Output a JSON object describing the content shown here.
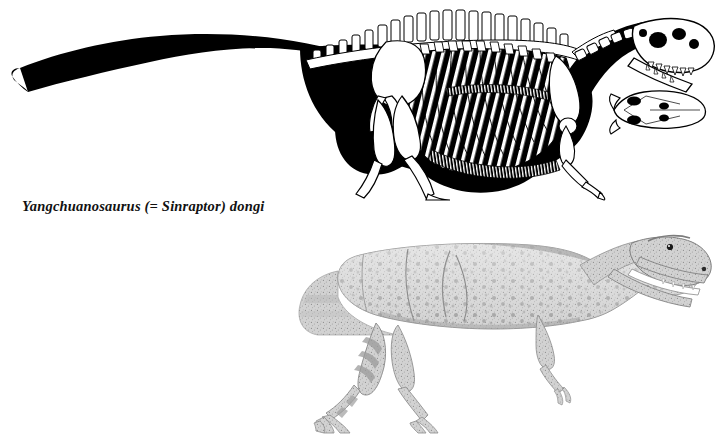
{
  "plate": {
    "background_color": "#ffffff",
    "width": 723,
    "height": 436,
    "caption": "Yangchuanosaurus (= Sinraptor) dongi",
    "caption_style": "italic-serif-bold",
    "ink_color": "#000000",
    "pencil_tone_color": "#8d8d8d"
  },
  "figures": [
    {
      "id": "skeletal-reconstruction",
      "label": "Yangchuanosaurus skeletal reconstruction",
      "technique": "ink line drawing, black body silhouette with white bones",
      "view": "lateral, facing right",
      "pose": "striding, mouth open",
      "parts": [
        "tail",
        "dorsal vertebrae",
        "neural spines",
        "ribcage",
        "gastralia",
        "pelvis",
        "ilium",
        "femur",
        "tibia",
        "metatarsus",
        "pes with claws",
        "scapula",
        "forelimb with manual claws",
        "cervical vertebrae",
        "skull with antorbital fenestra",
        "teeth"
      ]
    },
    {
      "id": "dorsal-skull-inset",
      "label": "skull in dorsal view",
      "technique": "ink line drawing with shaded fenestrae",
      "view": "dorsal"
    },
    {
      "id": "life-restoration",
      "label": "Yangchuanosaurus life restoration",
      "technique": "stippled graphite pencil drawing",
      "view": "lateral, facing right",
      "pose": "striding, mouth open",
      "skin_features": [
        "rounded scale spots",
        "banded markings on hind legs",
        "folded skin creases on flank",
        "crest above eye"
      ]
    }
  ]
}
